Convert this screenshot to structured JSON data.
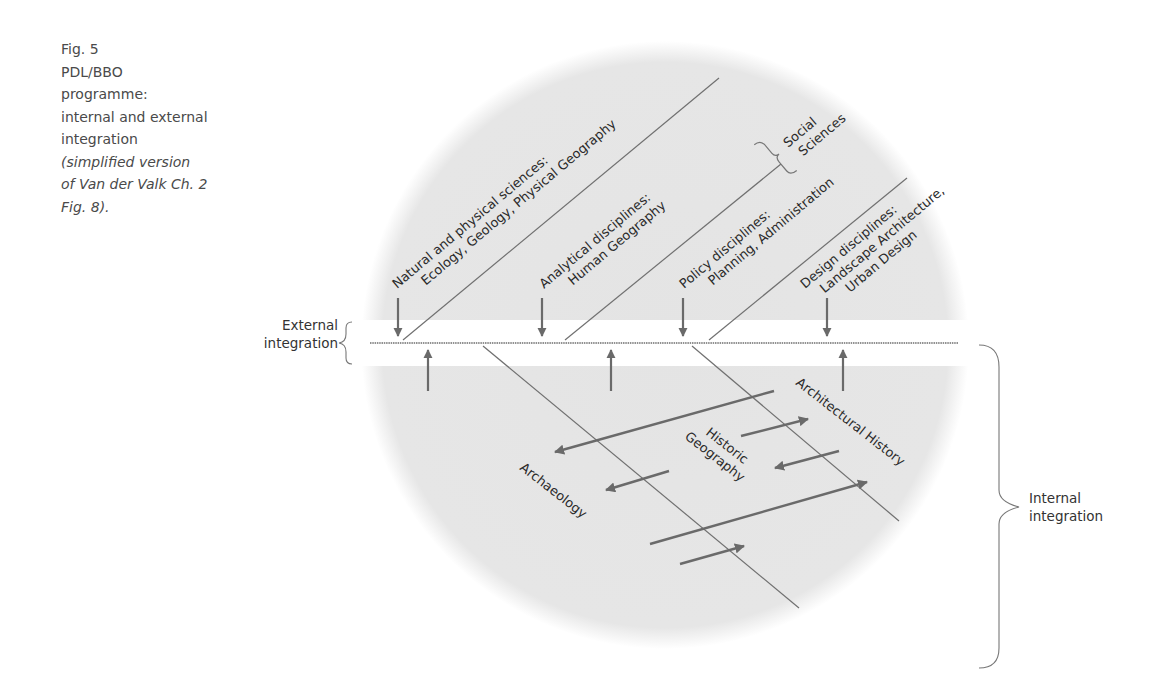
{
  "caption": {
    "fig": "Fig. 5",
    "lines": [
      "PDL/BBO",
      "programme:",
      "internal and external",
      "integration"
    ],
    "note_lines": [
      "(simplified version",
      "of Van der Valk Ch. 2",
      "Fig. 8)."
    ]
  },
  "colors": {
    "circle_fill": "#e5e5e5",
    "line": "#6e6e6e",
    "arrow": "#6a6a6a",
    "band": "#ffffff"
  },
  "external_integration": {
    "label_lines": [
      "External",
      "integration"
    ]
  },
  "internal_integration": {
    "label_lines": [
      "Internal",
      "integration"
    ]
  },
  "external_disciplines": [
    {
      "title": "Natural and physical sciences:",
      "subtitle": "Ecology, Geology, Physical Geography"
    },
    {
      "title": "Analytical disciplines:",
      "subtitle": "Human Geography"
    },
    {
      "title": "Policy disciplines:",
      "subtitle": "Planning, Administration"
    },
    {
      "title": "Design disciplines:",
      "subtitle": "Landscape Architecture,",
      "subtitle2": "Urban Design"
    }
  ],
  "social_sciences": {
    "line1": "Social",
    "line2": "Sciences"
  },
  "internal_disciplines": [
    {
      "label": "Archaeology"
    },
    {
      "label1": "Historic",
      "label2": "Geography"
    },
    {
      "label": "Architectural History"
    }
  ]
}
